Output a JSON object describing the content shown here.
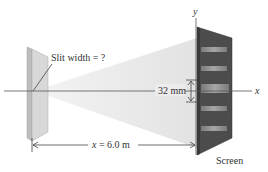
{
  "diagram": {
    "type": "single-slit diffraction setup",
    "labels": {
      "slit_width": "Slit width = ?",
      "fringe_spacing": "32 mm",
      "distance_var": "x",
      "distance_eq": " = 6.0 m",
      "screen": "Screen",
      "x_axis": "x",
      "y_axis": "y"
    },
    "values": {
      "distance_to_screen": "6.0 m",
      "central_max_half_width": "32 mm",
      "slit_width": "?"
    },
    "colors": {
      "slit_fill": "#d6d6d6",
      "slit_edge": "#a8a8a8",
      "screen_fill": "#4a4a4a",
      "screen_band": "#8c8c8c",
      "beam": "#ebebeb",
      "line": "#444444"
    }
  }
}
